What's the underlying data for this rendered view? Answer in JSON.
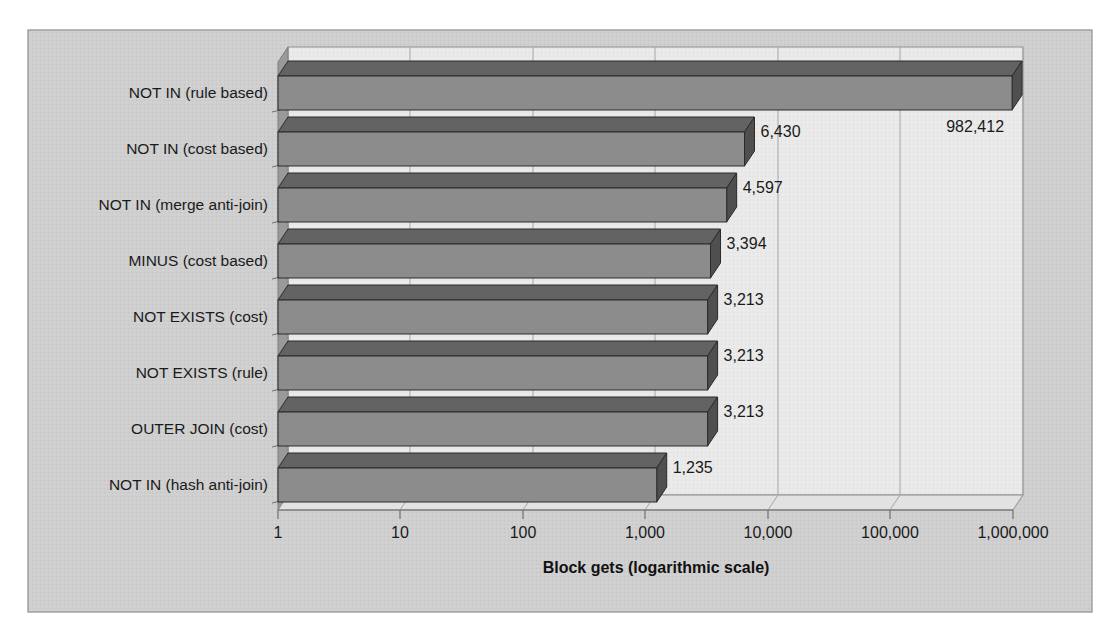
{
  "chart_data": {
    "type": "bar",
    "orientation": "horizontal",
    "title": "",
    "xlabel": "Block gets (logarithmic scale)",
    "ylabel": "",
    "scale": "log",
    "xlim": [
      1,
      1000000
    ],
    "grid": true,
    "legend": false,
    "tick_labels": [
      "1",
      "10",
      "100",
      "1,000",
      "10,000",
      "100,000",
      "1,000,000"
    ],
    "tick_values": [
      1,
      10,
      100,
      1000,
      10000,
      100000,
      1000000
    ],
    "categories": [
      "NOT IN (rule based)",
      "NOT IN (cost based)",
      "NOT IN (merge anti-join)",
      "MINUS (cost based)",
      "NOT EXISTS (cost)",
      "NOT EXISTS (rule)",
      "OUTER JOIN (cost)",
      "NOT IN (hash anti-join)"
    ],
    "values": [
      982412,
      6430,
      4597,
      3394,
      3213,
      3213,
      3213,
      1235
    ],
    "value_labels": [
      "982,412",
      "6,430",
      "4,597",
      "3,394",
      "3,213",
      "3,213",
      "3,213",
      "1,235"
    ]
  },
  "style": {
    "bar_front_color": "#8c8c8c",
    "bar_top_color": "#636363",
    "bar_side_color": "#4f4f4f",
    "plot_background": "#e9e9e9",
    "outer_background": "#cfcfcf",
    "wall_color": "#9a9a9a",
    "floor_color": "#e0e0e0",
    "gridline_color": "#9b9b9b",
    "border_color": "#8f8f8f",
    "text_color": "#1a1a1a"
  },
  "axis_title": "Block gets (logarithmic scale)"
}
